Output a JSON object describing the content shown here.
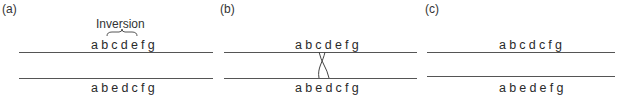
{
  "panels": [
    {
      "label": "(a)",
      "annotation": "Inversion",
      "top_sequence": "abcdefg",
      "bottom_sequence": "abedcfg"
    },
    {
      "label": "(b)",
      "top_sequence": "abcdefg",
      "bottom_sequence": "abedcfg",
      "crossover": "between d (top) and d/c region (bottom)"
    },
    {
      "label": "(c)",
      "top_sequence": "abcdcfg",
      "bottom_sequence": "abedefg"
    }
  ],
  "colors": {
    "line": "#555555",
    "text": "#2a2a2a"
  }
}
